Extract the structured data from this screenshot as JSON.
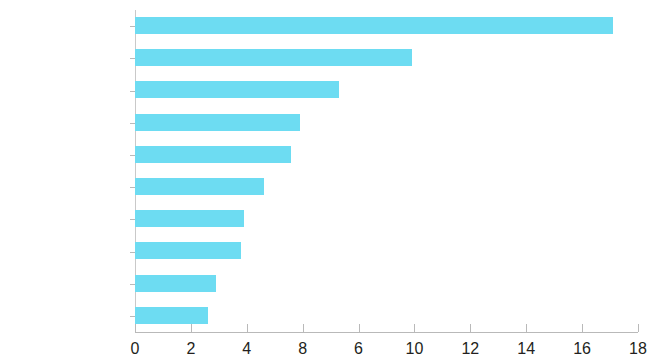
{
  "chart_data": {
    "type": "bar",
    "orientation": "horizontal",
    "title": "",
    "title_note": "title is cropped off the top edge of the screenshot and is not legible",
    "xlabel": "",
    "ylabel": "",
    "categories": [
      "India",
      "PRC",
      "Bangladesh",
      "Pakistan",
      "Philippines",
      "Afghanistan",
      "Indonesia",
      "Kazakhstan",
      "Myanmar",
      "Viet Nam"
    ],
    "values": [
      17.1,
      9.9,
      7.3,
      5.9,
      5.6,
      4.6,
      3.9,
      3.8,
      2.9,
      2.6
    ],
    "xlim": [
      0,
      18
    ],
    "xticks": [
      0,
      2,
      4,
      6,
      8,
      10,
      12,
      14,
      16,
      18
    ],
    "xtick_labels": [
      "0",
      "2",
      "4",
      "8",
      "6",
      "10",
      "12",
      "14",
      "16",
      "18"
    ],
    "xtick_labels_note": "printed labels at the 6 and 8 positions are transposed in the source image",
    "grid": false,
    "legend": null,
    "bar_color": "#6ddcf2",
    "axis_color": "#b9b9b9",
    "text_color": "#231f20"
  }
}
